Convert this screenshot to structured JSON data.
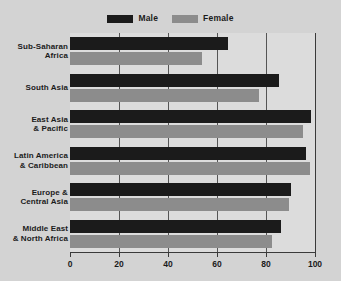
{
  "chart_data": {
    "type": "bar",
    "orientation": "horizontal",
    "title": "",
    "xlabel": "",
    "ylabel": "",
    "xlim": [
      0,
      100
    ],
    "xticks": [
      0,
      20,
      40,
      60,
      80,
      100
    ],
    "xtick_labels": [
      "0",
      "20",
      "40",
      "60",
      "80",
      "100"
    ],
    "grid": true,
    "grid_axis": "x",
    "legend_position": "top-center",
    "categories": [
      "Sub-Saharan Africa",
      "South Asia",
      "East Asia & Pacific",
      "Latin America & Caribbean",
      "Europe & Central Asia",
      "Middle East & North Africa"
    ],
    "category_lines": [
      [
        "Sub-Saharan",
        "Africa"
      ],
      [
        "South Asia"
      ],
      [
        "East Asia",
        "& Pacific"
      ],
      [
        "Latin America",
        "& Caribbean"
      ],
      [
        "Europe &",
        "Central Asia"
      ],
      [
        "Middle East",
        "& North Africa"
      ]
    ],
    "series": [
      {
        "name": "Male",
        "color": "#1b1b1b",
        "values": [
          64.5,
          85.5,
          98.5,
          96.5,
          90,
          86
        ]
      },
      {
        "name": "Female",
        "color": "#8c8c8c",
        "values": [
          54,
          77,
          95,
          98,
          89.5,
          82.5
        ]
      }
    ]
  },
  "legend": {
    "entries": [
      {
        "label": "Male",
        "color": "#1b1b1b"
      },
      {
        "label": "Female",
        "color": "#8c8c8c"
      }
    ]
  },
  "colors": {
    "background": "#d3d3d3",
    "plot_background": "#dcdcdc",
    "axis": "#3a3a3a",
    "gridline": "#555555",
    "text": "#1b1b1b",
    "male": "#1b1b1b",
    "female": "#8c8c8c"
  }
}
